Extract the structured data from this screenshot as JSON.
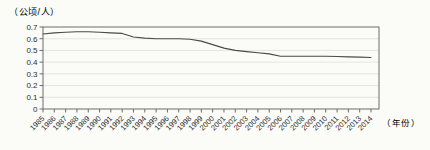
{
  "figure": {
    "unit_label_y": "（公顷/人）",
    "unit_label_x": "（年份）"
  },
  "chart_data": {
    "type": "line",
    "title": "",
    "xlabel": "（年份）",
    "ylabel": "（公顷/人）",
    "x": [
      "1985",
      "1986",
      "1987",
      "1988",
      "1989",
      "1990",
      "1991",
      "1992",
      "1993",
      "1994",
      "1995",
      "1996",
      "1997",
      "1998",
      "1999",
      "2000",
      "2001",
      "2002",
      "2003",
      "2004",
      "2005",
      "2006",
      "2007",
      "2008",
      "2009",
      "2010",
      "2011",
      "2012",
      "2013",
      "2014"
    ],
    "values": [
      0.64,
      0.65,
      0.655,
      0.66,
      0.66,
      0.655,
      0.65,
      0.645,
      0.615,
      0.605,
      0.6,
      0.6,
      0.6,
      0.595,
      0.58,
      0.55,
      0.52,
      0.5,
      0.49,
      0.48,
      0.47,
      0.45,
      0.45,
      0.45,
      0.45,
      0.45,
      0.448,
      0.445,
      0.443,
      0.44
    ],
    "ylim": [
      0,
      0.7
    ],
    "y_tick_labels": [
      "0.7",
      "0.6",
      "0.5",
      "0.4",
      "0.3",
      "0.2",
      "0.1",
      "0"
    ],
    "grid": true,
    "legend": "none"
  },
  "colors": {
    "background": "#fbfbf8",
    "plot_border": "#6c6c6c",
    "gridline": "#dededb",
    "line": "#4a4a4a",
    "text": "#2e2e2e"
  }
}
